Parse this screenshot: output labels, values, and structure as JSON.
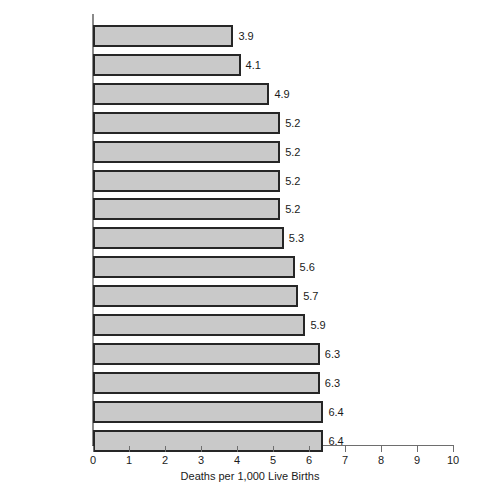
{
  "chart_data": {
    "type": "bar",
    "orientation": "horizontal",
    "title": "",
    "xlabel": "Deaths per 1,000 Live Births",
    "ylabel": "",
    "xlim": [
      0,
      10
    ],
    "xticks": [
      "0",
      "1",
      "2",
      "3",
      "4",
      "5",
      "6",
      "7",
      "8",
      "9",
      "10"
    ],
    "grid": false,
    "legend": false,
    "categories": [
      "Sweden",
      "Japan",
      "Switzerland",
      "Hong Kong",
      "Netherlands",
      "Germany",
      "Austria",
      "Australia",
      "Canada",
      "France",
      "United Kingdom",
      "Belgium",
      "Taiwan",
      "Italy",
      "United States"
    ],
    "values": [
      3.9,
      4.1,
      4.9,
      5.2,
      5.2,
      5.2,
      5.2,
      5.3,
      5.6,
      5.7,
      5.9,
      6.3,
      6.3,
      6.4,
      6.4
    ],
    "value_labels": [
      "3.9",
      "4.1",
      "4.9",
      "5.2",
      "5.2",
      "5.2",
      "5.2",
      "5.3",
      "5.6",
      "5.7",
      "5.9",
      "6.3",
      "6.3",
      "6.4",
      "6.4"
    ],
    "bar_fill_color": "#c9c9c9",
    "bar_border_color": "#262626",
    "axis_color": "#6e6e6e",
    "text_color": "#1a1a1a"
  }
}
